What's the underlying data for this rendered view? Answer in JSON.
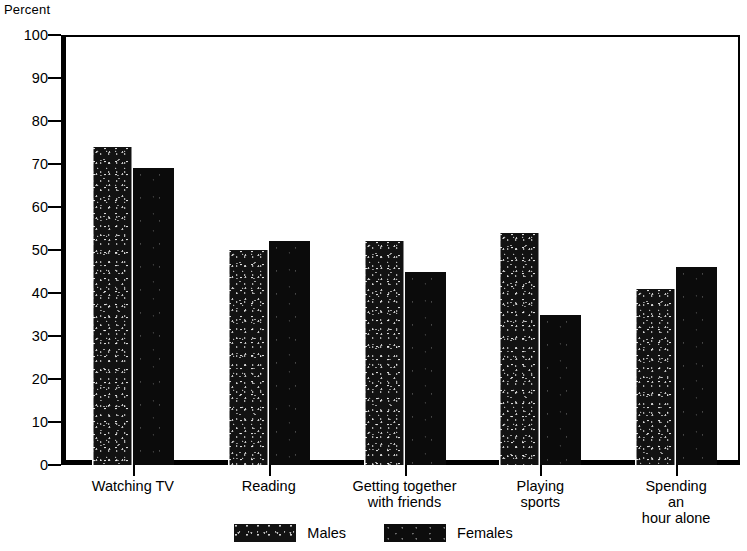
{
  "chart_data": {
    "type": "bar",
    "title": "",
    "subtitle": "",
    "xlabel": "",
    "ylabel": "Percent",
    "ylim": [
      0,
      100
    ],
    "yticks": [
      0,
      10,
      20,
      30,
      40,
      50,
      60,
      70,
      80,
      90,
      100
    ],
    "ytick_labels": [
      "0",
      "10",
      "20",
      "30",
      "40",
      "50",
      "60",
      "70",
      "80",
      "90",
      "100"
    ],
    "grid": false,
    "legend_position": "bottom-center",
    "categories": [
      "Watching TV",
      "Reading",
      "Getting together\nwith friends",
      "Playing\nsports",
      "Spending an\nhour alone"
    ],
    "series": [
      {
        "name": "Males",
        "color": "#121212",
        "values": [
          74,
          50,
          52,
          54,
          41
        ]
      },
      {
        "name": "Females",
        "color": "#0b0b0b",
        "values": [
          69,
          52,
          45,
          35,
          46
        ]
      }
    ]
  },
  "legend": {
    "items": [
      {
        "label": "Males",
        "swatch": "males-swatch"
      },
      {
        "label": "Females",
        "swatch": "females-swatch"
      }
    ]
  },
  "axis": {
    "y_title": "Percent"
  }
}
